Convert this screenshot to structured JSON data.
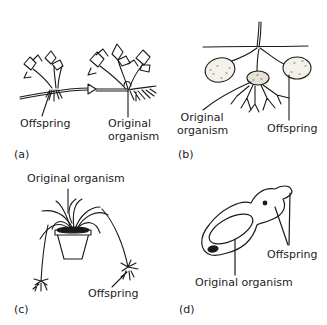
{
  "figure": {
    "panels": [
      {
        "id": "a",
        "tag": "(a)",
        "subject": "strawberry-runner",
        "labels": {
          "offspring": "Offspring",
          "original_line1": "Original",
          "original_line2": "organism"
        }
      },
      {
        "id": "b",
        "tag": "(b)",
        "subject": "potato-tubers",
        "labels": {
          "original_line1": "Original",
          "original_line2": "organism",
          "offspring": "Offspring"
        }
      },
      {
        "id": "c",
        "tag": "(c)",
        "subject": "spider-plant",
        "labels": {
          "original": "Original organism",
          "offspring": "Offspring"
        }
      },
      {
        "id": "d",
        "tag": "(d)",
        "subject": "budding-organism",
        "labels": {
          "offspring": "Offspring",
          "original": "Original organism"
        }
      }
    ],
    "colors": {
      "ink": "#1a1a1a",
      "background": "#ffffff",
      "fill_light": "#f4f1ea"
    }
  }
}
